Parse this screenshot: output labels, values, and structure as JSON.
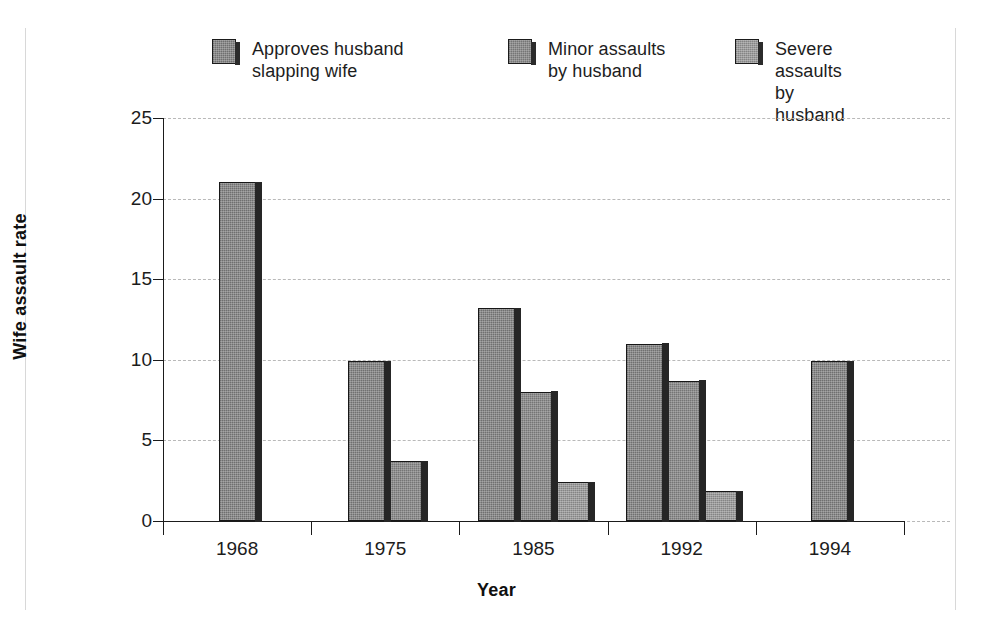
{
  "chart_data": {
    "type": "bar",
    "title": "",
    "xlabel": "Year",
    "ylabel": "Wife assault rate",
    "categories": [
      "1968",
      "1975",
      "1985",
      "1992",
      "1994"
    ],
    "series": [
      {
        "name": "Approves husband slapping wife",
        "values": [
          21.0,
          9.9,
          13.2,
          11.0,
          9.9
        ],
        "color": "#8b8b8b"
      },
      {
        "name": "Minor assaults by husband",
        "values": [
          null,
          3.7,
          8.0,
          8.7,
          null
        ],
        "color": "#8f8f8f"
      },
      {
        "name": "Severe assaults by husband",
        "values": [
          null,
          null,
          2.4,
          1.85,
          null
        ],
        "color": "#9b9b9b"
      }
    ],
    "ylim": [
      0,
      25
    ],
    "yticks": [
      0,
      5,
      10,
      15,
      20,
      25
    ],
    "ytick_labels": [
      "0",
      "5",
      "10",
      "15",
      "20",
      "25"
    ],
    "grid": "horizontal-dashed",
    "legend_position": "top"
  },
  "legend": {
    "items": [
      {
        "label": "Approves husband\nslapping wife"
      },
      {
        "label": "Minor assaults\nby husband"
      },
      {
        "label": "Severe assaults\nby husband"
      }
    ]
  },
  "axes": {
    "y_title": "Wife assault rate",
    "x_title": "Year",
    "y_ticks": [
      "25",
      "20",
      "15",
      "10",
      "5",
      "0"
    ],
    "x_ticks": [
      "1968",
      "1975",
      "1985",
      "1992",
      "1994"
    ]
  }
}
